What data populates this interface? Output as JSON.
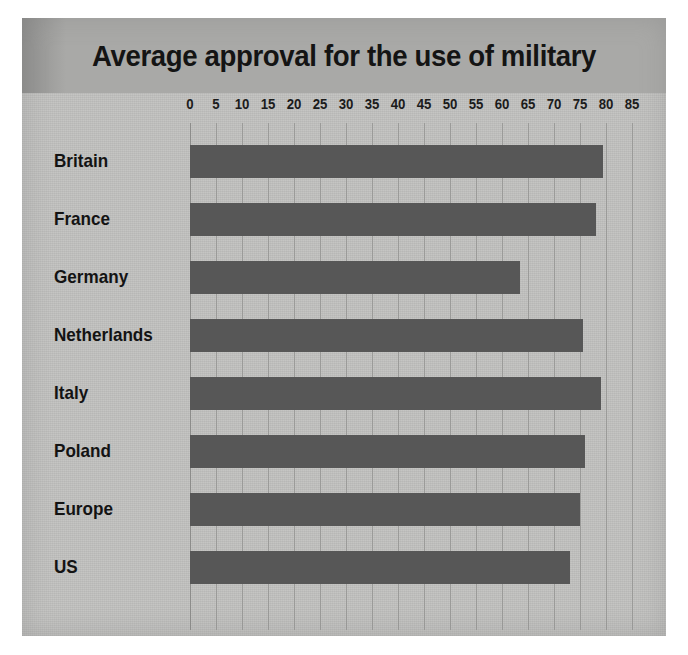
{
  "chart_data": {
    "type": "bar",
    "orientation": "horizontal",
    "title": "Average approval for the use of military",
    "xlabel": "",
    "ylabel": "",
    "categories": [
      "Britain",
      "France",
      "Germany",
      "Netherlands",
      "Italy",
      "Poland",
      "Europe",
      "US"
    ],
    "values": [
      79.5,
      78,
      63.5,
      75.5,
      79,
      76,
      75,
      73
    ],
    "series": [
      {
        "name": "Average approval",
        "values": [
          79.5,
          78,
          63.5,
          75.5,
          79,
          76,
          75,
          73
        ]
      }
    ],
    "xlim": [
      0,
      85
    ],
    "xticks": [
      0,
      5,
      10,
      15,
      20,
      25,
      30,
      35,
      40,
      45,
      50,
      55,
      60,
      65,
      70,
      75,
      80,
      85
    ],
    "xtick_labels": [
      "0",
      "5",
      "10",
      "15",
      "20",
      "25",
      "30",
      "35",
      "40",
      "45",
      "50",
      "55",
      "60",
      "65",
      "70",
      "75",
      "80",
      "85"
    ],
    "grid": true,
    "grid_axis": "x",
    "legend": false,
    "legend_position": "none",
    "bar_color": "#575757",
    "panel_color": "#c2c2c0",
    "title_band_color": "#a9a9a7",
    "gridline_color": "#9b9b99",
    "text_color": "#131313"
  }
}
